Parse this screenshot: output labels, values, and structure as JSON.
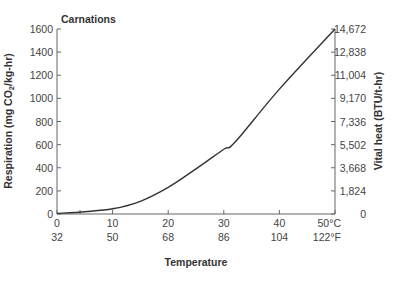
{
  "chart_data": {
    "type": "line",
    "title": "Carnations",
    "xlabel": "Temperature",
    "ylabel": "Respiration (mg CO2/kg-hr)",
    "y2label": "Vital heat (BTU/t-hr)",
    "x_ticks_c": [
      "0",
      "10",
      "20",
      "30",
      "40",
      "50°C"
    ],
    "x_ticks_f": [
      "32",
      "50",
      "68",
      "86",
      "104",
      "122°F"
    ],
    "y_ticks": [
      "0",
      "200",
      "400",
      "600",
      "800",
      "1000",
      "1200",
      "1400",
      "1600"
    ],
    "y2_ticks": [
      "0",
      "1,824",
      "3,668",
      "5,502",
      "7,336",
      "9,170",
      "11,004",
      "12,838",
      "14,672"
    ],
    "xlim": [
      0,
      50
    ],
    "ylim": [
      0,
      1600
    ],
    "grid": false,
    "series": [
      {
        "name": "Carnations",
        "x": [
          0,
          5,
          10,
          15,
          20,
          25,
          30,
          32,
          40,
          50
        ],
        "values": [
          5,
          20,
          45,
          110,
          230,
          390,
          560,
          620,
          1080,
          1600
        ]
      }
    ]
  }
}
